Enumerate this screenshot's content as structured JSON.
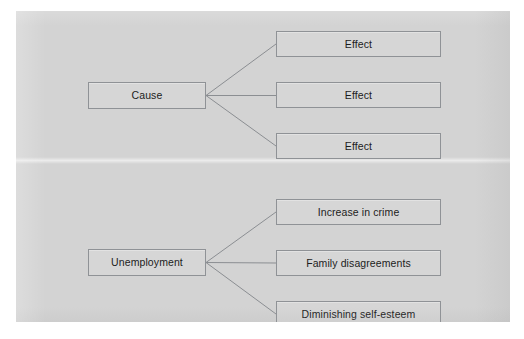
{
  "page": {
    "background_color": "#ffffff",
    "canvas_color": "#d3d3d3",
    "node_fill_color": "#d6d6d6",
    "node_border_color": "#8f9296",
    "connector_color": "#8b8e92",
    "text_color": "#1c1c1c"
  },
  "diagrams": [
    {
      "name": "generic-cause-effect-diagram",
      "cause": {
        "label": "Cause",
        "x": 88,
        "y": 71,
        "width": 118,
        "height": 27
      },
      "effects": [
        {
          "label": "Effect",
          "x": 276,
          "y": 20,
          "width": 165,
          "height": 26
        },
        {
          "label": "Effect",
          "x": 276,
          "y": 71,
          "width": 165,
          "height": 26
        },
        {
          "label": "Effect",
          "x": 276,
          "y": 122,
          "width": 165,
          "height": 26
        }
      ]
    },
    {
      "name": "unemployment-cause-effect-diagram",
      "cause": {
        "label": "Unemployment",
        "x": 88,
        "y": 238,
        "width": 118,
        "height": 27
      },
      "effects": [
        {
          "label": "Increase in crime",
          "x": 276,
          "y": 188,
          "width": 165,
          "height": 26
        },
        {
          "label": "Family disagreements",
          "x": 276,
          "y": 239,
          "width": 165,
          "height": 26
        },
        {
          "label": "Diminishing self-esteem",
          "x": 276,
          "y": 290,
          "width": 165,
          "height": 26
        }
      ]
    }
  ]
}
